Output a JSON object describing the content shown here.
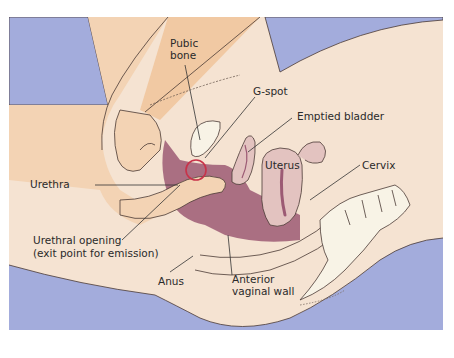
{
  "diagram": {
    "colors": {
      "background_blue": "#a3acdc",
      "skin_light": "#f6e3cf",
      "skin_mid": "#f3d3b4",
      "skin_orange": "#f1c9a3",
      "tissue_mauve": "#9c5a74",
      "uterus_pink": "#e3c3c0",
      "bone_white": "#f8f3e6",
      "gspot_circle": "#c8334a",
      "outline": "#4a3a35"
    },
    "labels": {
      "pubic_bone": [
        "Pubic",
        "bone"
      ],
      "g_spot": "G-spot",
      "emptied_bladder": "Emptied bladder",
      "uterus": "Uterus",
      "cervix": "Cervix",
      "urethra": "Urethra",
      "urethral_opening": [
        "Urethral opening",
        "(exit point for emission)"
      ],
      "anus": "Anus",
      "anterior_vaginal_wall": [
        "Anterior",
        "vaginal wall"
      ]
    }
  }
}
